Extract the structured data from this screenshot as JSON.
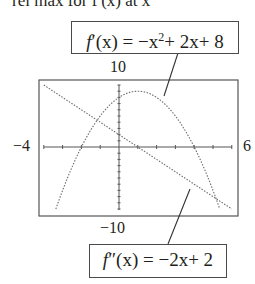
{
  "heading_partial": "rel max for f′(x) at x",
  "chart_data": {
    "type": "line",
    "title": "",
    "window": {
      "xmin": -4,
      "xmax": 6,
      "ymin": -10,
      "ymax": 10
    },
    "tick_labels": {
      "xmin": "−4",
      "xmax": "6",
      "ymax": "10",
      "ymin": "−10"
    },
    "grid": false,
    "series": [
      {
        "name": "f′(x) = −x² + 2x + 8",
        "style": "dotted",
        "x": [
          -3.36,
          -3,
          -2,
          -1,
          0,
          1,
          2,
          3,
          4,
          5,
          5.36
        ],
        "values": [
          -10,
          -7,
          0,
          5,
          8,
          9,
          8,
          5,
          0,
          -7,
          -10
        ]
      },
      {
        "name": "f″(x) = −2x + 2",
        "style": "dotted",
        "x": [
          -4,
          -2,
          0,
          1,
          2,
          4,
          6
        ],
        "values": [
          10,
          6,
          2,
          0,
          -2,
          -6,
          -10
        ]
      }
    ],
    "annotations": [
      {
        "text": "f′(x) = −x²+ 2x+ 8",
        "points_to": "parabola"
      },
      {
        "text": "f″(x) = −2x+ 2",
        "points_to": "line"
      }
    ]
  },
  "labels": {
    "top_box": {
      "fname": "f",
      "prime": "′",
      "rest": "(x) = −x",
      "sup": "2",
      "tail": "+ 2x+ 8"
    },
    "bottom_box": {
      "fname": "f",
      "prime": "″",
      "rest": "(x) = −2x+ 2"
    },
    "xmin": "−4",
    "xmax": "6",
    "ymax": "10",
    "ymin": "−10"
  }
}
